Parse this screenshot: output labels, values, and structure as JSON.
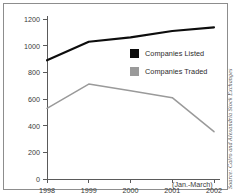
{
  "chart_data": {
    "type": "line",
    "title": "",
    "subtitle": "",
    "xlabel": "",
    "ylabel": "",
    "categories": [
      "1998",
      "1999",
      "2000",
      "2001",
      "2002"
    ],
    "x_sublabel": "(Jan.-March)",
    "ylim": [
      0,
      1200
    ],
    "yticks": [
      0,
      200,
      400,
      600,
      800,
      1000,
      1200
    ],
    "ytick_labels": [
      "0",
      "200",
      "400",
      "600",
      "800",
      "1000",
      "1200"
    ],
    "grid": false,
    "legend_position": "center-right",
    "series": [
      {
        "name": "Companies Listed",
        "color": "#0d0d0d",
        "values": [
          890,
          1030,
          1062,
          1110,
          1137
        ]
      },
      {
        "name": "Companies Traded",
        "color": "#9a9a9a",
        "values": [
          530,
          712,
          662,
          610,
          355
        ]
      }
    ],
    "source": "Source: Cairo and Alexandria Stock Exchanges"
  },
  "legend": {
    "items": [
      {
        "label": "Companies Listed",
        "color": "#0d0d0d"
      },
      {
        "label": "Companies Traded",
        "color": "#9a9a9a"
      }
    ]
  },
  "axis": {
    "color": "#5a5a5a"
  }
}
